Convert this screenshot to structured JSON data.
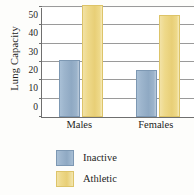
{
  "chart_data": {
    "type": "bar",
    "title": "",
    "xlabel": "",
    "ylabel": "Lung Capacity",
    "categories": [
      "Males",
      "Females"
    ],
    "series": [
      {
        "name": "Inactive",
        "color": "#8fa9c3",
        "values": [
          31,
          25.5
        ]
      },
      {
        "name": "Athletic",
        "color": "#eed98a",
        "values": [
          61,
          55.5
        ]
      }
    ],
    "ylim": [
      0,
      60
    ],
    "yticks": [
      0,
      10,
      20,
      30,
      40,
      50,
      60
    ],
    "ytick_labels": [
      "0",
      "10",
      "20",
      "30",
      "40",
      "50",
      "60"
    ],
    "grid": true,
    "legend_position": "bottom-left"
  }
}
